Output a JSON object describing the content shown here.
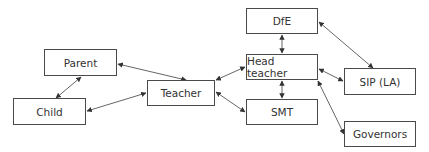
{
  "diagram": {
    "type": "relationship-map",
    "nodes": [
      {
        "id": "parent",
        "label": "Parent",
        "x": 44,
        "y": 49,
        "w": 73,
        "h": 27
      },
      {
        "id": "child",
        "label": "Child",
        "x": 13,
        "y": 98,
        "w": 73,
        "h": 27
      },
      {
        "id": "teacher",
        "label": "Teacher",
        "x": 147,
        "y": 80,
        "w": 68,
        "h": 26
      },
      {
        "id": "dfe",
        "label": "DfE",
        "x": 246,
        "y": 8,
        "w": 72,
        "h": 26
      },
      {
        "id": "head",
        "label": "Head teacher",
        "x": 246,
        "y": 54,
        "w": 72,
        "h": 26
      },
      {
        "id": "smt",
        "label": "SMT",
        "x": 246,
        "y": 99,
        "w": 72,
        "h": 26
      },
      {
        "id": "sip",
        "label": "SIP (LA)",
        "x": 344,
        "y": 68,
        "w": 72,
        "h": 27
      },
      {
        "id": "governors",
        "label": "Governors",
        "x": 344,
        "y": 121,
        "w": 72,
        "h": 26
      }
    ],
    "edges": [
      {
        "from": "parent",
        "to": "child",
        "x1": 81,
        "y1": 77,
        "x2": 56,
        "y2": 98
      },
      {
        "from": "parent",
        "to": "teacher",
        "x1": 118,
        "y1": 64,
        "x2": 186,
        "y2": 80
      },
      {
        "from": "child",
        "to": "teacher",
        "x1": 87,
        "y1": 111,
        "x2": 146,
        "y2": 93
      },
      {
        "from": "teacher",
        "to": "head",
        "x1": 216,
        "y1": 80,
        "x2": 245,
        "y2": 67
      },
      {
        "from": "teacher",
        "to": "smt",
        "x1": 216,
        "y1": 92,
        "x2": 245,
        "y2": 112
      },
      {
        "from": "dfe",
        "to": "head",
        "x1": 282,
        "y1": 35,
        "x2": 282,
        "y2": 53
      },
      {
        "from": "head",
        "to": "smt",
        "x1": 282,
        "y1": 81,
        "x2": 282,
        "y2": 98
      },
      {
        "from": "dfe",
        "to": "sip",
        "x1": 319,
        "y1": 22,
        "x2": 373,
        "y2": 68
      },
      {
        "from": "head",
        "to": "sip",
        "x1": 319,
        "y1": 69,
        "x2": 343,
        "y2": 81
      },
      {
        "from": "head",
        "to": "governors",
        "x1": 318,
        "y1": 81,
        "x2": 344,
        "y2": 134
      }
    ],
    "colors": {
      "stroke": "#4a4a4a",
      "text": "#333333",
      "background": "#ffffff"
    }
  }
}
